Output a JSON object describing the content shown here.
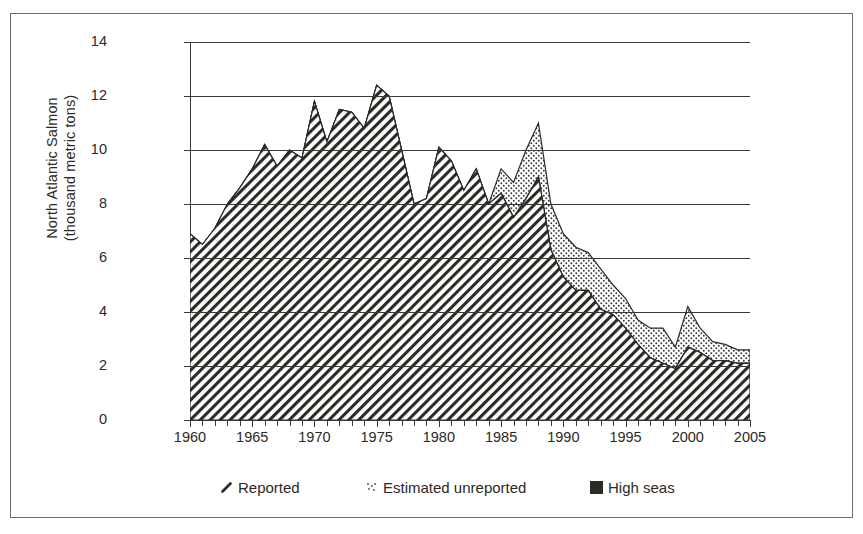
{
  "chart_data": {
    "type": "area",
    "title": "",
    "xlabel": "",
    "ylabel": "North Atlantic Salmon\n(thousand metric tons)",
    "ylabel_line1": "North Atlantic Salmon",
    "ylabel_line2": "(thousand metric tons)",
    "xlim": [
      1960,
      2005
    ],
    "ylim": [
      0,
      14
    ],
    "yticks": [
      0,
      2,
      4,
      6,
      8,
      10,
      12,
      14
    ],
    "ytick_labels": [
      "0",
      "2",
      "4",
      "6",
      "8",
      "10",
      "12",
      "14"
    ],
    "xticks": [
      1960,
      1965,
      1970,
      1975,
      1980,
      1985,
      1990,
      1995,
      2000,
      2005
    ],
    "xtick_labels": [
      "1960",
      "1965",
      "1970",
      "1975",
      "1980",
      "1985",
      "1990",
      "1995",
      "2000",
      "2005"
    ],
    "xtick_interval_minor": 1,
    "grid": "horizontal",
    "stacked": true,
    "legend_position": "bottom",
    "x": [
      1960,
      1961,
      1962,
      1963,
      1964,
      1965,
      1966,
      1967,
      1968,
      1969,
      1970,
      1971,
      1972,
      1973,
      1974,
      1975,
      1976,
      1977,
      1978,
      1979,
      1980,
      1981,
      1982,
      1983,
      1984,
      1985,
      1986,
      1987,
      1988,
      1989,
      1990,
      1991,
      1992,
      1993,
      1994,
      1995,
      1996,
      1997,
      1998,
      1999,
      2000,
      2001,
      2002,
      2003,
      2004,
      2005
    ],
    "series": [
      {
        "name": "Reported",
        "pattern": "diagonal-hatch",
        "color": "#2b2a26",
        "values": [
          6.9,
          6.5,
          7.1,
          8.0,
          8.6,
          9.3,
          10.2,
          9.4,
          10.0,
          9.7,
          11.8,
          10.3,
          11.5,
          11.4,
          10.8,
          12.4,
          12.0,
          10.0,
          8.0,
          8.2,
          10.1,
          9.6,
          8.5,
          9.3,
          8.0,
          8.4,
          7.5,
          8.2,
          9.0,
          6.3,
          5.3,
          4.8,
          4.8,
          4.1,
          3.9,
          3.4,
          2.8,
          2.3,
          2.1,
          1.9,
          2.7,
          2.5,
          2.2,
          2.2,
          2.1,
          2.1
        ]
      },
      {
        "name": "Estimated unreported",
        "pattern": "stipple-dots",
        "color": "#2b2a26",
        "values": [
          0,
          0,
          0,
          0,
          0,
          0,
          0,
          0,
          0,
          0,
          0,
          0,
          0,
          0,
          0,
          0,
          0,
          0,
          0,
          0,
          0,
          0,
          0,
          0,
          0,
          0.9,
          1.3,
          1.8,
          2.0,
          1.7,
          1.6,
          1.6,
          1.4,
          1.5,
          1.1,
          1.1,
          0.9,
          1.1,
          1.3,
          0.8,
          1.5,
          0.9,
          0.7,
          0.6,
          0.5,
          0.5
        ]
      },
      {
        "name": "High seas",
        "pattern": "solid",
        "color": "#2b2a26",
        "values": [
          0,
          0,
          0,
          0,
          0,
          0,
          0,
          0,
          0,
          0,
          0,
          0,
          0,
          0,
          0,
          0,
          0,
          0,
          0,
          0,
          0,
          0,
          0,
          0,
          0,
          0,
          0,
          0,
          0,
          0,
          0,
          0,
          0,
          0,
          0,
          0,
          0,
          0,
          0,
          0,
          0,
          0,
          0,
          0,
          0,
          0
        ]
      }
    ],
    "legend": [
      {
        "label": "Reported",
        "swatch": "hatch-swatch-icon"
      },
      {
        "label": "Estimated unreported",
        "swatch": "dots-swatch-icon"
      },
      {
        "label": "High seas",
        "swatch": "solid-swatch-icon"
      }
    ]
  },
  "colors": {
    "ink": "#2b2a26",
    "axis": "#3a3935",
    "frame": "#6f6f68",
    "background": "#ffffff"
  }
}
